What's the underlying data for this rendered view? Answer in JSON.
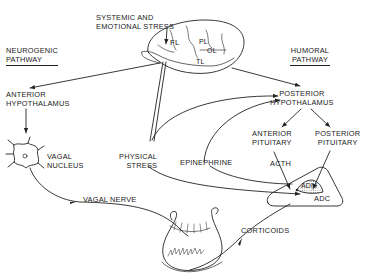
{
  "diagram": {
    "type": "physiological-flow",
    "colors": {
      "ink": "#222222",
      "background": "#ffffff",
      "stipple": "#888888"
    },
    "headers": {
      "neurogenic": {
        "line1": "NEUROGENIC",
        "line2": "PATHWAY"
      },
      "humoral": {
        "line1": "HUMORAL",
        "line2": "PATHWAY"
      }
    },
    "nodes": {
      "stress_top": {
        "line1": "SYSTEMIC AND",
        "line2": "EMOTIONAL STRESS"
      },
      "brain": {
        "lobes": [
          "FL",
          "PL",
          "OL",
          "TL"
        ]
      },
      "anterior_hypothalamus": {
        "line1": "ANTERIOR",
        "line2": "HYPOTHALAMUS"
      },
      "posterior_hypothalamus": {
        "line1": "POSTERIOR",
        "line2": "HYPOTHALAMUS"
      },
      "vagal_nucleus": {
        "line1": "VAGAL",
        "line2": "NUCLEUS"
      },
      "physical_stress": {
        "line1": "PHYSICAL",
        "line2": "STRESS"
      },
      "epinephrine": {
        "label": "EPINEPHRINE"
      },
      "anterior_pituitary": {
        "line1": "ANTERIOR",
        "line2": "PITUITARY"
      },
      "posterior_pituitary": {
        "line1": "POSTERIOR",
        "line2": "PITUITARY"
      },
      "acth": {
        "label": "ACTH"
      },
      "adm": {
        "label": "ADM"
      },
      "adc": {
        "label": "ADC"
      },
      "vagal_nerve": {
        "label": "VAGAL NERVE"
      },
      "corticoids": {
        "label": "CORTICOIDS"
      },
      "stomach": {
        "label": ""
      }
    },
    "edges": [
      {
        "from": "SYSTEMIC AND EMOTIONAL STRESS",
        "to": "brain"
      },
      {
        "from": "brain",
        "to": "ANTERIOR HYPOTHALAMUS"
      },
      {
        "from": "brain",
        "to": "POSTERIOR HYPOTHALAMUS"
      },
      {
        "from": "ANTERIOR HYPOTHALAMUS",
        "to": "VAGAL NUCLEUS"
      },
      {
        "from": "VAGAL NUCLEUS",
        "to": "stomach",
        "label": "VAGAL NERVE"
      },
      {
        "from": "PHYSICAL STRESS",
        "to": "brain"
      },
      {
        "from": "PHYSICAL STRESS",
        "to": "POSTERIOR HYPOTHALAMUS"
      },
      {
        "from": "PHYSICAL STRESS",
        "to": "ADM"
      },
      {
        "from": "EPINEPHRINE",
        "to": "POSTERIOR HYPOTHALAMUS"
      },
      {
        "from": "EPINEPHRINE",
        "to": "ADM"
      },
      {
        "from": "POSTERIOR HYPOTHALAMUS",
        "to": "ANTERIOR PITUITARY"
      },
      {
        "from": "POSTERIOR HYPOTHALAMUS",
        "to": "POSTERIOR PITUITARY"
      },
      {
        "from": "ANTERIOR PITUITARY",
        "to": "adrenal",
        "label": "ACTH"
      },
      {
        "from": "POSTERIOR PITUITARY",
        "to": "ADM"
      },
      {
        "from": "ADC",
        "to": "stomach",
        "label": "CORTICOIDS"
      }
    ]
  }
}
